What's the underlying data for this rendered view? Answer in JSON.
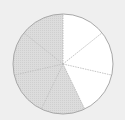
{
  "diagram": {
    "type": "fraction-circle",
    "total_parts": 7,
    "shaded_parts": 4,
    "unshaded_parts": 3,
    "center": [
      63,
      64
    ],
    "radius": 50,
    "colors": {
      "background": "#efefef",
      "shaded": "#d9d9d9",
      "unshaded": "#ffffff",
      "outline": "#a8a8a8",
      "divider": "#b8b8b8"
    },
    "sectors": [
      {
        "index": 0,
        "shaded": false
      },
      {
        "index": 1,
        "shaded": false
      },
      {
        "index": 2,
        "shaded": false
      },
      {
        "index": 3,
        "shaded": true
      },
      {
        "index": 4,
        "shaded": true
      },
      {
        "index": 5,
        "shaded": true
      },
      {
        "index": 6,
        "shaded": true
      }
    ]
  }
}
